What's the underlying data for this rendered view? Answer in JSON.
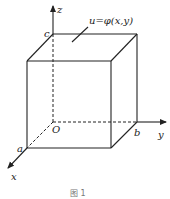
{
  "diagram": {
    "type": "3d-box-coordinate-system",
    "axes": {
      "x": {
        "label": "x"
      },
      "y": {
        "label": "y"
      },
      "z": {
        "label": "z"
      }
    },
    "origin_label": "O",
    "points": {
      "a": "a",
      "b": "b",
      "c": "c"
    },
    "surface_annotation": "u=φ(x,y)",
    "caption": "图 1"
  },
  "colors": {
    "line": "#222222",
    "background": "#ffffff"
  }
}
